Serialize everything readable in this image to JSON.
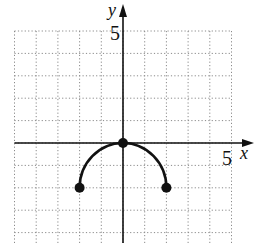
{
  "chart_data": {
    "type": "line",
    "title": "",
    "xlabel": "x",
    "ylabel": "y",
    "x_tick_label": "5",
    "y_tick_label": "5",
    "xlim": [
      -5,
      5
    ],
    "ylim": [
      -4.5,
      5
    ],
    "grid": true,
    "grid_style": "dotted",
    "grid_step": 1,
    "series": [
      {
        "name": "curve",
        "description": "upper semicircle centered at (0,-2), radius 2",
        "x": [
          -2,
          -1.732,
          -1,
          0,
          1,
          1.732,
          2
        ],
        "y": [
          -2,
          -1,
          -0.268,
          0,
          -0.268,
          -1,
          -2
        ]
      }
    ],
    "points": [
      {
        "x": -2,
        "y": -2,
        "filled": true
      },
      {
        "x": 0,
        "y": 0,
        "filled": true
      },
      {
        "x": 2,
        "y": -2,
        "filled": true
      }
    ],
    "colors": {
      "curve": "#111111",
      "axes": "#111111",
      "grid": "#8a8a8a"
    }
  }
}
